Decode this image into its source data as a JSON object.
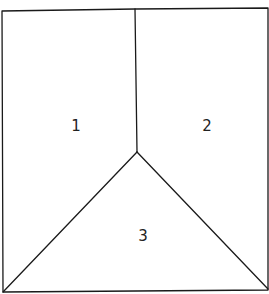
{
  "diagram": {
    "type": "partitioned-square",
    "stroke_color": "#1a1a1a",
    "background": "#ffffff",
    "regions": [
      {
        "id": "region-1",
        "label": "1",
        "x": 76,
        "y": 131
      },
      {
        "id": "region-2",
        "label": "2",
        "x": 207,
        "y": 131
      },
      {
        "id": "region-3",
        "label": "3",
        "x": 143,
        "y": 241
      }
    ]
  }
}
